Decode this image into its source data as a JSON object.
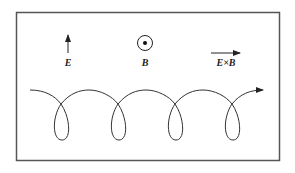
{
  "diagram": {
    "vectors": {
      "electric_field": {
        "label": "E",
        "direction": "up"
      },
      "magnetic_field": {
        "label": "B",
        "direction": "out of page"
      },
      "drift": {
        "label": "E×B",
        "direction": "right"
      }
    },
    "trajectory": {
      "description": "cycloidal/trochoidal drift path with loops",
      "loops": 4,
      "direction": "right"
    },
    "colors": {
      "stroke": "#333333",
      "frame": "#555555",
      "background": "#ffffff"
    }
  }
}
